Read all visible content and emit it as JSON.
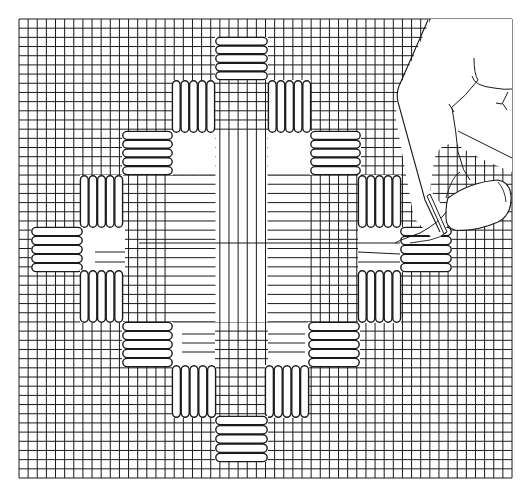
{
  "figure": {
    "title": "Needlepoint canvas with diamond stitch pattern",
    "colors": {
      "ink": "#1a1a1a",
      "paper": "#ffffff"
    }
  },
  "canvas": {
    "x0": 19,
    "y0": 19,
    "x1": 512,
    "y1": 478,
    "cols": 54,
    "rows": 50
  },
  "blank_regions": [
    {
      "name": "center-left-white-top",
      "x": 172,
      "y": 133,
      "w": 43,
      "h": 42
    },
    {
      "name": "center-right-white-top",
      "x": 268,
      "y": 133,
      "w": 42,
      "h": 42
    },
    {
      "name": "left-inner-white",
      "x": 83,
      "y": 228,
      "w": 42,
      "h": 44
    },
    {
      "name": "center-left-white-bottom",
      "x": 172,
      "y": 322,
      "w": 43,
      "h": 45
    },
    {
      "name": "center-right-white-bottom",
      "x": 268,
      "y": 322,
      "w": 42,
      "h": 45
    },
    {
      "name": "right-inner-white",
      "x": 358,
      "y": 228,
      "w": 42,
      "h": 44
    }
  ],
  "vertical_only_regions": [
    {
      "name": "central-column",
      "x": 215,
      "y": 133,
      "w": 53,
      "h": 189
    }
  ],
  "horizontal_only_regions": [
    {
      "name": "left-band",
      "x": 172,
      "y": 175,
      "w": 43,
      "h": 147
    },
    {
      "name": "right-band",
      "x": 268,
      "y": 175,
      "w": 42,
      "h": 147
    }
  ],
  "long_threads": [
    {
      "x1": 139,
      "y1": 243,
      "x2": 420,
      "y2": 243
    },
    {
      "x1": 95,
      "y1": 252,
      "x2": 125,
      "y2": 252
    },
    {
      "x1": 95,
      "y1": 262,
      "x2": 125,
      "y2": 262
    },
    {
      "x1": 182,
      "y1": 334,
      "x2": 215,
      "y2": 334
    },
    {
      "x1": 182,
      "y1": 343,
      "x2": 215,
      "y2": 343
    },
    {
      "x1": 182,
      "y1": 352,
      "x2": 215,
      "y2": 352
    },
    {
      "x1": 268,
      "y1": 334,
      "x2": 305,
      "y2": 334
    },
    {
      "x1": 268,
      "y1": 343,
      "x2": 305,
      "y2": 343
    },
    {
      "x1": 268,
      "y1": 352,
      "x2": 305,
      "y2": 352
    },
    {
      "x1": 358,
      "y1": 252,
      "x2": 400,
      "y2": 254
    },
    {
      "x1": 358,
      "y1": 262,
      "x2": 400,
      "y2": 262
    }
  ],
  "stitch_blocks": [
    {
      "name": "block-top",
      "orient": "h",
      "x": 215,
      "y": 37,
      "w": 53,
      "h": 43,
      "n": 5
    },
    {
      "name": "block-upper-left",
      "orient": "v",
      "x": 172,
      "y": 80,
      "w": 43,
      "h": 53,
      "n": 5
    },
    {
      "name": "block-upper-right",
      "orient": "v",
      "x": 268,
      "y": 80,
      "w": 43,
      "h": 53,
      "n": 5
    },
    {
      "name": "block-left-2-top",
      "orient": "h",
      "x": 122,
      "y": 131,
      "w": 51,
      "h": 44,
      "n": 5
    },
    {
      "name": "block-right-2-top",
      "orient": "h",
      "x": 310,
      "y": 131,
      "w": 51,
      "h": 44,
      "n": 5
    },
    {
      "name": "block-left-3-top",
      "orient": "v",
      "x": 80,
      "y": 175,
      "w": 43,
      "h": 53,
      "n": 5
    },
    {
      "name": "block-right-3-top",
      "orient": "v",
      "x": 358,
      "y": 175,
      "w": 43,
      "h": 53,
      "n": 5
    },
    {
      "name": "block-left-end",
      "orient": "h",
      "x": 31,
      "y": 227,
      "w": 52,
      "h": 45,
      "n": 5
    },
    {
      "name": "block-right-end",
      "orient": "h",
      "x": 400,
      "y": 227,
      "w": 52,
      "h": 45,
      "n": 5
    },
    {
      "name": "block-left-3-bottom",
      "orient": "v",
      "x": 80,
      "y": 270,
      "w": 43,
      "h": 53,
      "n": 5
    },
    {
      "name": "block-right-3-bottom",
      "orient": "v",
      "x": 358,
      "y": 270,
      "w": 43,
      "h": 53,
      "n": 5
    },
    {
      "name": "block-left-2-bottom",
      "orient": "h",
      "x": 122,
      "y": 322,
      "w": 51,
      "h": 45,
      "n": 5
    },
    {
      "name": "block-right-2-bottom",
      "orient": "h",
      "x": 308,
      "y": 322,
      "w": 52,
      "h": 45,
      "n": 5
    },
    {
      "name": "block-lower-left",
      "orient": "v",
      "x": 172,
      "y": 365,
      "w": 44,
      "h": 53,
      "n": 5
    },
    {
      "name": "block-lower-right",
      "orient": "v",
      "x": 265,
      "y": 365,
      "w": 44,
      "h": 53,
      "n": 5
    },
    {
      "name": "block-bottom",
      "orient": "h",
      "x": 215,
      "y": 416,
      "w": 53,
      "h": 46,
      "n": 5
    }
  ],
  "hand": {
    "label": "hand holding needle"
  }
}
